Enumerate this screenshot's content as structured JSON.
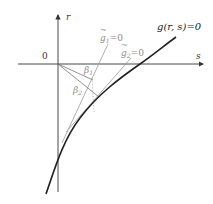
{
  "figure": {
    "axes": {
      "x_label": "s",
      "y_label": "r",
      "origin_label": "0"
    },
    "curves": [
      {
        "name": "constraint-curve",
        "label": "g(r, s)=0",
        "color": "#222222"
      }
    ],
    "lines": [
      {
        "name": "linearization-1",
        "label_base": "g",
        "label_sub": "1",
        "label_suffix": "=0",
        "color": "#9a9a9a"
      },
      {
        "name": "linearization-2",
        "label_base": "g",
        "label_sub": "2",
        "label_suffix": "=0",
        "color": "#9a9a9a"
      }
    ],
    "angles": [
      {
        "name": "beta-1",
        "symbol": "β",
        "sub": "1"
      },
      {
        "name": "beta-2",
        "symbol": "β",
        "sub": "2"
      }
    ],
    "colors": {
      "axis": "#333333",
      "curve": "#222222",
      "construction": "#9a9a9a"
    }
  }
}
